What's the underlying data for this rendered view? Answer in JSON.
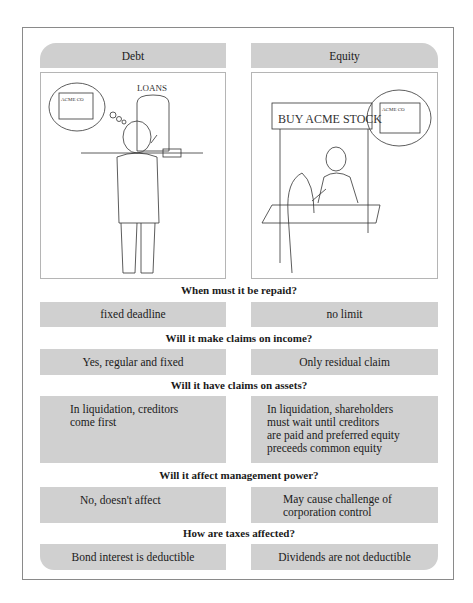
{
  "columns": {
    "left": {
      "header": "Debt"
    },
    "right": {
      "header": "Equity"
    }
  },
  "illustrations": {
    "debt": {
      "sign_text": "LOANS",
      "building_label": "ACME CO",
      "description": "Man at loan window thinking of ACME Co building"
    },
    "equity": {
      "sign_text": "BUY ACME STOCK",
      "building_label": "ACME CO",
      "description": "Woman buying stock from man at booth thinking of ACME Co building"
    }
  },
  "rows": [
    {
      "question": "When must it be repaid?",
      "debt": "fixed deadline",
      "equity": "no limit"
    },
    {
      "question": "Will it make claims on income?",
      "debt": "Yes, regular and fixed",
      "equity": "Only residual claim"
    },
    {
      "question": "Will it have claims on assets?",
      "debt": [
        "In liquidation, creditors",
        "come first"
      ],
      "equity": [
        "In liquidation, shareholders",
        "must wait until creditors",
        "are paid and preferred equity",
        "preceeds common equity"
      ]
    },
    {
      "question": "Will it affect management power?",
      "debt": "No, doesn't affect",
      "equity": [
        "May cause challenge of",
        "corporation control"
      ]
    },
    {
      "question": "How are taxes affected?",
      "debt": "Bond interest is deductible",
      "equity": "Dividends are not deductible"
    }
  ],
  "colors": {
    "cell_bg": "#d0d0d0",
    "frame": "#8a8a8a",
    "text": "#1a1a1a"
  }
}
